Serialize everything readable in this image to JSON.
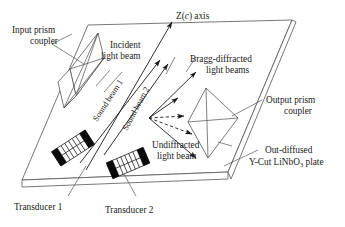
{
  "figure": {
    "background_color": "#ffffff",
    "line_color": "#4a4a4a",
    "beam_color": "#1a1a1a",
    "accent_black": "#0a0a0a"
  },
  "labels": {
    "input_prism_line1": "Input prism",
    "input_prism_line2": "coupler",
    "incident_line1": "Incident",
    "incident_line2": "light beam",
    "z_axis_pre": "Z(",
    "z_axis_ital": "c",
    "z_axis_post": ") axis",
    "bragg_line1": "Bragg-diffracted",
    "bragg_line2": "light beams",
    "output_prism_line1": "Output prism",
    "output_prism_line2": "coupler",
    "out_diffused_line1": "Out-diffused",
    "out_diffused_line2_pre": "Y-Cut LiNbO",
    "out_diffused_sub": "3",
    "out_diffused_line2_post": " plate",
    "undiffracted_line1": "Undiffracted",
    "undiffracted_line2": "light beam",
    "sound_beam_1": "Sound beam 1",
    "sound_beam_2": "Sound beam 2",
    "transducer_1": "Transducer 1",
    "transducer_2": "Transducer 2"
  },
  "geometry": {
    "plate_top_face": "88,25 292,20 228,172 22,180",
    "plate_front_edge": "22,180 228,172 228,179 22,187",
    "plate_right_edge": "228,172 292,20 296,22 231,179",
    "input_prism_faces": [
      "70,69 98,33 104,58 76,96",
      "70,69 76,96 64,108 58,82",
      "64,108 76,96 104,58"
    ],
    "input_prism_lines": [
      "70,69 104,58",
      "98,33 76,96",
      "98,33 64,108"
    ],
    "output_prism_faces": [
      "206,88 238,118 208,158 188,122"
    ],
    "output_prism_lines": [
      "206,88 208,158",
      "188,122 238,118"
    ],
    "z_axis_arrow": "86,170 172,22",
    "incident_beams": [
      "80,163 160,60",
      "104,155 168,64"
    ],
    "interaction_point": "149,118",
    "bragg_solid_arrows": [
      "149,118 196,72",
      "149,118 178,98"
    ],
    "bragg_dashed_arrows": [
      "149,118 184,116",
      "149,118 192,134"
    ],
    "undiffracted_arrow": "149,118 196,158",
    "transducer_1": {
      "cx": 73,
      "cy": 148,
      "w": 40,
      "h": 17,
      "angle": -33,
      "fingers": 5
    },
    "transducer_2": {
      "cx": 128,
      "cy": 163,
      "w": 40,
      "h": 17,
      "angle": -23,
      "fingers": 5
    },
    "sound_beam_1_text": {
      "x": 97,
      "y": 122,
      "angle": -57
    },
    "sound_beam_2_text": {
      "x": 127,
      "y": 131,
      "angle": -62
    },
    "leaders": {
      "input_prism": [
        "52,44 84,64",
        "52,44 72,34"
      ],
      "incident": [
        "110,70 96,86",
        "122,72 104,92"
      ],
      "bragg": [
        "175,57 166,74",
        "196,57 186,72"
      ],
      "output_prism": [
        "262,100 232,116"
      ],
      "out_diffused": [
        "258,150 224,166"
      ],
      "undiffracted": [
        "218,142 232,146"
      ],
      "transducer_1": [
        "68,196 86,166"
      ],
      "transducer_2": [
        "136,196 124,174"
      ]
    }
  },
  "text_positions": {
    "input_prism": {
      "x": 12,
      "y": 33
    },
    "incident": {
      "x": 106,
      "y": 48
    },
    "z_axis": {
      "x": 176,
      "y": 19
    },
    "bragg": {
      "x": 190,
      "y": 62
    },
    "output_prism": {
      "x": 266,
      "y": 103
    },
    "out_diffused": {
      "x": 262,
      "y": 153
    },
    "undiffracted": {
      "x": 152,
      "y": 148
    },
    "transducer_1": {
      "x": 14,
      "y": 210
    },
    "transducer_2": {
      "x": 105,
      "y": 213
    }
  }
}
